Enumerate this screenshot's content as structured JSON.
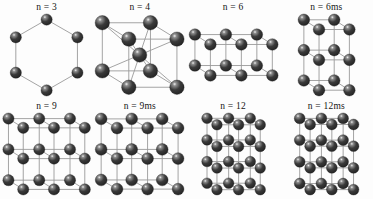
{
  "figure": {
    "background_color": "#fdfdfd",
    "sphere_color": "#3a3a3a",
    "sphere_dark_color": "#222222",
    "sphere_highlight_color": "#f2f2f2",
    "bond_color": "#9a9a9a",
    "label_color": "#141414",
    "rows": 2,
    "columns": 4
  },
  "clusters": [
    {
      "id": "n3",
      "label": "n = 3",
      "structure": "hexagonal-ring",
      "atom_count": 6,
      "sphere_radius": 5.6,
      "projection": {
        "scale": 1.0,
        "ax": 0.52,
        "ay": 0.3
      },
      "atoms": [
        [
          0.0,
          1.0,
          0.0
        ],
        [
          0.87,
          0.5,
          0.0
        ],
        [
          0.87,
          -0.5,
          0.0
        ],
        [
          0.0,
          -1.0,
          0.0
        ],
        [
          -0.87,
          -0.5,
          0.0
        ],
        [
          -0.87,
          0.5,
          0.0
        ]
      ],
      "bonds": [
        [
          0,
          1
        ],
        [
          1,
          2
        ],
        [
          2,
          3
        ],
        [
          3,
          4
        ],
        [
          4,
          5
        ],
        [
          5,
          0
        ]
      ]
    },
    {
      "id": "n4",
      "label": "n = 4",
      "structure": "cube",
      "atom_count": 9,
      "sphere_radius": 7.2,
      "projection": {
        "scale": 1.0,
        "ax": 0.55,
        "ay": 0.34
      },
      "grid": {
        "nx": 2,
        "ny": 2,
        "nz": 2,
        "center": true,
        "spacing": 1.0
      }
    },
    {
      "id": "n6",
      "label": "n = 6",
      "structure": "lattice-3x2x2",
      "atom_count": 12,
      "sphere_radius": 5.8,
      "projection": {
        "scale": 1.0,
        "ax": 0.5,
        "ay": 0.32
      },
      "grid": {
        "nx": 3,
        "ny": 2,
        "nz": 2,
        "center": false,
        "spacing": 1.0
      }
    },
    {
      "id": "n6ms",
      "label": "n = 6ms",
      "structure": "lattice-2x3x2",
      "atom_count": 12,
      "sphere_radius": 5.8,
      "projection": {
        "scale": 1.0,
        "ax": 0.5,
        "ay": 0.32
      },
      "grid": {
        "nx": 2,
        "ny": 3,
        "nz": 2,
        "center": false,
        "spacing": 1.0
      }
    },
    {
      "id": "n9",
      "label": "n = 9",
      "structure": "lattice-3x3x2",
      "atom_count": 18,
      "sphere_radius": 5.6,
      "projection": {
        "scale": 1.0,
        "ax": 0.48,
        "ay": 0.3
      },
      "grid": {
        "nx": 3,
        "ny": 3,
        "nz": 2,
        "center": false,
        "spacing": 1.0
      }
    },
    {
      "id": "n9ms",
      "label": "n = 9ms",
      "structure": "lattice-3x3x2-shift",
      "atom_count": 18,
      "sphere_radius": 5.9,
      "projection": {
        "scale": 1.0,
        "ax": 0.52,
        "ay": 0.3
      },
      "grid": {
        "nx": 3,
        "ny": 3,
        "nz": 2,
        "center": false,
        "spacing": 1.0
      }
    },
    {
      "id": "n12",
      "label": "n = 12",
      "structure": "lattice-3x4x2",
      "atom_count": 24,
      "sphere_radius": 5.3,
      "projection": {
        "scale": 1.0,
        "ax": 0.46,
        "ay": 0.3
      },
      "grid": {
        "nx": 3,
        "ny": 4,
        "nz": 2,
        "center": false,
        "spacing": 1.0
      }
    },
    {
      "id": "n12ms",
      "label": "n = 12ms",
      "structure": "lattice-4x4x2",
      "atom_count": 24,
      "sphere_radius": 5.4,
      "projection": {
        "scale": 1.0,
        "ax": 0.48,
        "ay": 0.28
      },
      "grid": {
        "nx": 3,
        "ny": 4,
        "nz": 2,
        "center": false,
        "spacing": 1.0
      }
    }
  ]
}
